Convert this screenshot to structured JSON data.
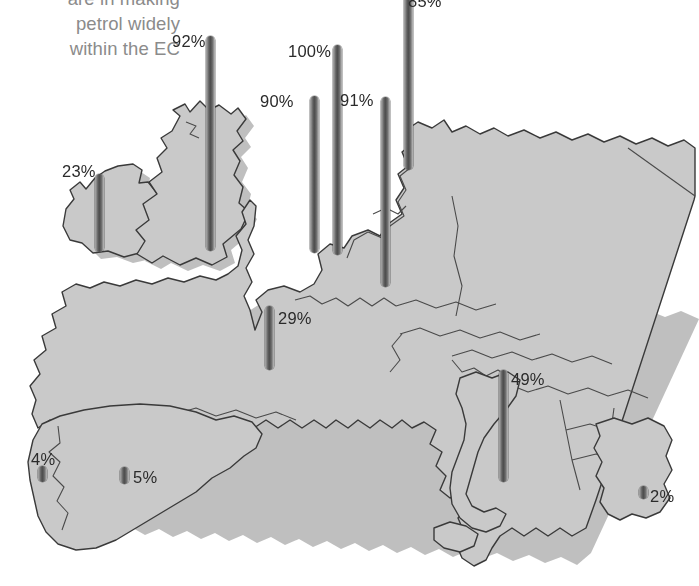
{
  "caption": {
    "lines": [
      "are in making",
      "petrol widely",
      "within the EC"
    ],
    "color": "#8b8b8b",
    "note": "heading is cropped at the top edge of the screenshot"
  },
  "map": {
    "title": "Map of Western and Central Europe",
    "fill_color": "#c9c9c9",
    "outline_color": "#3a3a3a",
    "background_color": "#ffffff"
  },
  "chart_data": {
    "type": "bar",
    "xlabel": "",
    "ylabel": "Percent",
    "ylim": [
      0,
      100
    ],
    "unit": "%",
    "bar_color": "#585858",
    "categories": [
      "Ireland",
      "United Kingdom",
      "Netherlands",
      "Denmark",
      "Belgium",
      "Germany",
      "France",
      "Italy",
      "Portugal",
      "Spain",
      "Greece"
    ],
    "values": [
      23,
      92,
      90,
      100,
      91,
      85,
      29,
      49,
      4,
      5,
      2
    ],
    "labels": [
      "23%",
      "92%",
      "90%",
      "100%",
      "91%",
      "85%",
      "29%",
      "49%",
      "4%",
      "5%",
      "2%"
    ],
    "legend": []
  },
  "markers": [
    {
      "name": "ireland",
      "label": "23%",
      "value": 23,
      "x": 95,
      "top": 174,
      "height": 78,
      "label_x": 62,
      "label_y": 163
    },
    {
      "name": "united-kingdom",
      "label": "92%",
      "value": 92,
      "x": 206,
      "top": 36,
      "height": 215,
      "label_x": 172,
      "label_y": 33
    },
    {
      "name": "netherlands",
      "label": "90%",
      "value": 90,
      "x": 310,
      "top": 96,
      "height": 157,
      "label_x": 260,
      "label_y": 93
    },
    {
      "name": "denmark",
      "label": "100%",
      "value": 100,
      "x": 333,
      "top": 45,
      "height": 210,
      "label_x": 288,
      "label_y": 43
    },
    {
      "name": "belgium",
      "label": "91%",
      "value": 91,
      "x": 381,
      "top": 97,
      "height": 190,
      "label_x": 340,
      "label_y": 92
    },
    {
      "name": "germany",
      "label": "85%",
      "value": 85,
      "x": 404,
      "top": -26,
      "height": 196,
      "label_x": 408,
      "label_y": -7
    },
    {
      "name": "france",
      "label": "29%",
      "value": 29,
      "x": 265,
      "top": 306,
      "height": 64,
      "label_x": 278,
      "label_y": 310
    },
    {
      "name": "italy",
      "label": "49%",
      "value": 49,
      "x": 499,
      "top": 370,
      "height": 112,
      "label_x": 511,
      "label_y": 371
    },
    {
      "name": "portugal",
      "label": "4%",
      "value": 4,
      "x": 38,
      "top": 466,
      "height": 16,
      "label_x": 31,
      "label_y": 451
    },
    {
      "name": "spain",
      "label": "5%",
      "value": 5,
      "x": 120,
      "top": 467,
      "height": 17,
      "label_x": 133,
      "label_y": 469
    },
    {
      "name": "greece",
      "label": "2%",
      "value": 2,
      "x": 639,
      "top": 486,
      "height": 13,
      "label_x": 650,
      "label_y": 488
    }
  ]
}
